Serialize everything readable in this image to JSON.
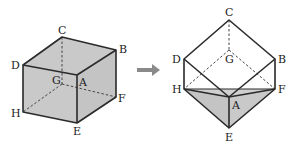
{
  "colors": {
    "face": "#c9c9c9",
    "edge": "#2a2a2a",
    "hidden": "#444444",
    "arrow": "#8a8a8a",
    "background": "#ffffff"
  },
  "left_cube": {
    "vertices": {
      "C": [
        62,
        37
      ],
      "B": [
        116,
        50
      ],
      "D": [
        23,
        65
      ],
      "A": [
        77,
        75
      ],
      "G": [
        62,
        84
      ],
      "F": [
        116,
        97
      ],
      "H": [
        23,
        112
      ],
      "E": [
        77,
        123
      ]
    },
    "labels": {
      "C": "C",
      "B": "B",
      "D": "D",
      "A": "A",
      "G": "G",
      "F": "F",
      "H": "H",
      "E": "E"
    }
  },
  "arrow": {
    "icon": "right-arrow-icon"
  },
  "right_cube": {
    "vertices": {
      "C": [
        229,
        20
      ],
      "D": [
        184,
        59
      ],
      "B": [
        275,
        59
      ],
      "G": [
        229,
        50
      ],
      "H": [
        184,
        89
      ],
      "F": [
        275,
        89
      ],
      "A": [
        229,
        97
      ],
      "E": [
        229,
        128
      ]
    },
    "labels": {
      "C": "C",
      "D": "D",
      "B": "B",
      "G": "G",
      "H": "H",
      "F": "F",
      "A": "A",
      "E": "E"
    }
  }
}
